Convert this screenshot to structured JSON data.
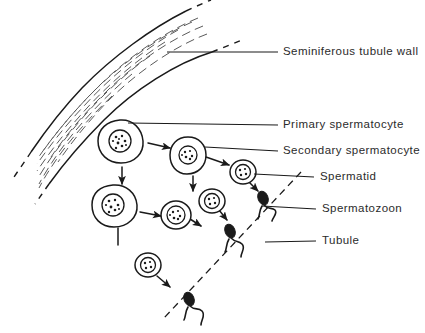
{
  "figure": {
    "background_color": "#ffffff",
    "ink_color": "#1a1a1a",
    "text_color": "#2b2b2b",
    "width": 425,
    "height": 333
  },
  "labels": [
    {
      "id": "seminiferous-tubule-wall",
      "text": "Seminiferous tubule wall",
      "x": 283,
      "y": 52
    },
    {
      "id": "primary-spermatocyte",
      "text": "Primary spermatocyte",
      "x": 283,
      "y": 125
    },
    {
      "id": "secondary-spermatocyte",
      "text": "Secondary spermatocyte",
      "x": 283,
      "y": 151
    },
    {
      "id": "spermatid",
      "text": "Spermatid",
      "x": 320,
      "y": 177
    },
    {
      "id": "spermatozoon",
      "text": "Spermatozoon",
      "x": 322,
      "y": 209
    },
    {
      "id": "tubule",
      "text": "Tubule",
      "x": 322,
      "y": 241
    }
  ],
  "leader_lines": [
    {
      "id": "leader-wall",
      "from_x": 167,
      "from_y": 52,
      "to_x": 278,
      "to_y": 52
    },
    {
      "id": "leader-primary",
      "from_x": 128,
      "from_y": 123,
      "to_x": 278,
      "to_y": 125
    },
    {
      "id": "leader-secondary",
      "from_x": 205,
      "from_y": 147,
      "to_x": 278,
      "to_y": 151
    },
    {
      "id": "leader-spermatid",
      "from_x": 254,
      "from_y": 174,
      "to_x": 314,
      "to_y": 177
    },
    {
      "id": "leader-spermatozoon",
      "from_x": 262,
      "from_y": 206,
      "to_x": 316,
      "to_y": 209
    },
    {
      "id": "leader-tubule",
      "from_x": 265,
      "from_y": 242,
      "to_x": 316,
      "to_y": 241
    }
  ],
  "cells": {
    "primary_spermatocytes": [
      {
        "id": "primary-1",
        "cx": 120,
        "cy": 141,
        "r": 21
      },
      {
        "id": "primary-2",
        "cx": 113,
        "cy": 205,
        "r": 21
      }
    ],
    "secondary_spermatocytes": [
      {
        "id": "secondary-1",
        "cx": 188,
        "cy": 154,
        "r": 17
      },
      {
        "id": "secondary-2",
        "cx": 176,
        "cy": 215,
        "r": 14
      }
    ],
    "spermatids": [
      {
        "id": "spermatid-1",
        "cx": 243,
        "cy": 172,
        "r": 12
      },
      {
        "id": "spermatid-2",
        "cx": 212,
        "cy": 201,
        "r": 12
      },
      {
        "id": "spermatid-3",
        "cx": 148,
        "cy": 265,
        "r": 12
      }
    ],
    "spermatozoa": [
      {
        "id": "spermatozoon-1",
        "x": 261,
        "y": 196
      },
      {
        "id": "spermatozoon-2",
        "x": 228,
        "y": 229
      },
      {
        "id": "spermatozoon-3",
        "x": 187,
        "y": 297
      }
    ]
  },
  "arrows": [
    {
      "id": "arrow-primary1-to-secondary1",
      "x1": 148,
      "y1": 143,
      "x2": 172,
      "y2": 148
    },
    {
      "id": "arrow-primary1-down",
      "x1": 122,
      "y1": 167,
      "x2": 122,
      "y2": 185
    },
    {
      "id": "arrow-secondary1-to-spermatid1",
      "x1": 206,
      "y1": 157,
      "x2": 231,
      "y2": 165
    },
    {
      "id": "arrow-secondary1-down",
      "x1": 193,
      "y1": 175,
      "x2": 193,
      "y2": 192
    },
    {
      "id": "arrow-spermatid1-to-sperm1",
      "x1": 249,
      "y1": 183,
      "x2": 259,
      "y2": 192
    },
    {
      "id": "arrow-primary2-to-secondary2",
      "x1": 140,
      "y1": 212,
      "x2": 163,
      "y2": 216
    },
    {
      "id": "arrow-primary2-down",
      "x1": 118,
      "y1": 227,
      "x2": 118,
      "y2": 244
    },
    {
      "id": "arrow-secondary2-to-spermatid2",
      "x1": 190,
      "y1": 218,
      "x2": 203,
      "y2": 226
    },
    {
      "id": "arrow-spermatid3-to-sperm3",
      "x1": 157,
      "y1": 277,
      "x2": 171,
      "y2": 288
    }
  ],
  "lumen_line": {
    "id": "tubule-lumen",
    "from_x": 301,
    "from_y": 172,
    "to_x": 164,
    "to_y": 318,
    "style": "dashed"
  },
  "tubule_wall": {
    "id": "seminiferous-wall",
    "description": "curved band with dashed striations",
    "outer_edge": "M 196 4 C 150 22 96 62 60 108 C 36 138 20 160 8 180",
    "inner_edge": "M 215 44 C 170 58 118 96 86 134 C 62 162 46 180 32 196",
    "stria_count": 8
  }
}
